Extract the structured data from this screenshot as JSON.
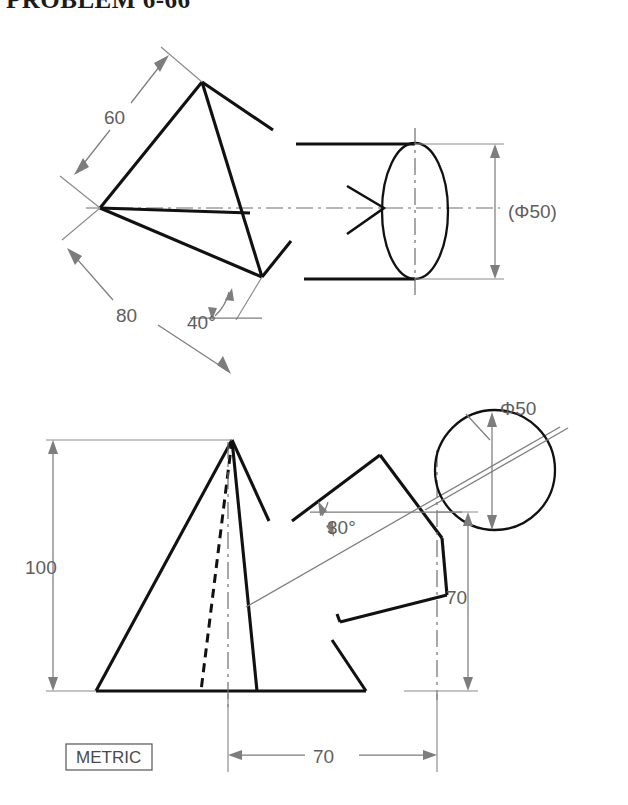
{
  "page": {
    "title": "PROBLEM 6-66",
    "units_note": "METRIC",
    "background_color": "#ffffff",
    "line_color": "#111111",
    "dimension_color": "#7d7d7d"
  },
  "views": {
    "top_view": {
      "name": "top-view",
      "dimensions": [
        {
          "id": "d60",
          "label": "60",
          "kind": "linear-inclined"
        },
        {
          "id": "d80",
          "label": "80",
          "kind": "linear-inclined"
        },
        {
          "id": "a40",
          "label": "40°",
          "kind": "angular"
        },
        {
          "id": "dia50ref",
          "label": "(Φ50)",
          "kind": "diameter-reference"
        }
      ],
      "annotations": [
        {
          "id": "view-arrow",
          "label": "view-direction-arrow"
        }
      ]
    },
    "front_view": {
      "name": "front-view",
      "dimensions": [
        {
          "id": "d100",
          "label": "100",
          "kind": "linear-vertical"
        },
        {
          "id": "a30",
          "label": "30°",
          "kind": "angular"
        },
        {
          "id": "d70v",
          "label": "70",
          "kind": "linear-vertical"
        },
        {
          "id": "d70h",
          "label": "70",
          "kind": "linear-horizontal"
        },
        {
          "id": "dia50",
          "label": "Φ50",
          "kind": "diameter"
        }
      ]
    }
  },
  "labels": {
    "d60": "60",
    "d80": "80",
    "a40": "40°",
    "dia50ref": "(Φ50)",
    "d100": "100",
    "a30": "30°",
    "d70v": "70",
    "d70h": "70",
    "dia50": "Φ50",
    "metric": "METRIC"
  }
}
